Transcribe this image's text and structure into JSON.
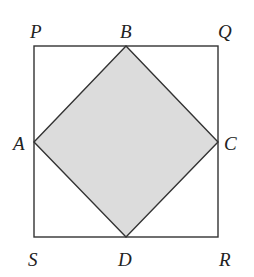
{
  "diagram": {
    "type": "geometry",
    "outer_square": {
      "vertices": [
        "P",
        "Q",
        "R",
        "S"
      ]
    },
    "inner_square": {
      "vertices": [
        "A",
        "B",
        "C",
        "D"
      ],
      "fill": "#dcdcdc",
      "shaded": true
    },
    "labels": {
      "P": "P",
      "B": "B",
      "Q": "Q",
      "A": "A",
      "C": "C",
      "S": "S",
      "D": "D",
      "R": "R"
    },
    "colors": {
      "stroke": "#333333",
      "shade": "#dcdcdc"
    }
  }
}
